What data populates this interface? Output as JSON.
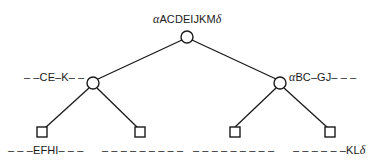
{
  "diagram": {
    "type": "binary-tree",
    "stroke_color": "#1a1a1a",
    "background": "#ffffff",
    "nodes": {
      "root": {
        "shape": "circle",
        "label_prefix": "α",
        "label_main": "ACDEIJKM",
        "label_suffix": "δ"
      },
      "left": {
        "shape": "circle",
        "label_main": "– –CE–K– –"
      },
      "right": {
        "shape": "circle",
        "label_prefix": "α",
        "label_main": "BC–GJ– – –"
      },
      "leaf_ll": {
        "shape": "square",
        "label_main": "– – –EFHI– – –"
      },
      "leaf_lr": {
        "shape": "square",
        "label_main": "– – – – – – – – –"
      },
      "leaf_rl": {
        "shape": "square",
        "label_main": "– – – – – – – – –"
      },
      "leaf_rr": {
        "shape": "square",
        "label_main": "– – – – – –KL",
        "label_suffix": "δ"
      }
    },
    "edges": [
      [
        "root",
        "left"
      ],
      [
        "root",
        "right"
      ],
      [
        "left",
        "leaf_ll"
      ],
      [
        "left",
        "leaf_lr"
      ],
      [
        "right",
        "leaf_rl"
      ],
      [
        "right",
        "leaf_rr"
      ]
    ]
  }
}
